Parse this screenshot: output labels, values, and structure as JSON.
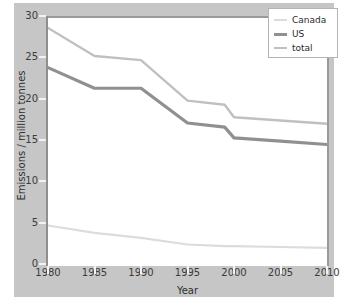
{
  "chart_data": {
    "type": "line",
    "title": "",
    "xlabel": "Year",
    "ylabel": "Emissions / million tonnes",
    "xlim": [
      1980,
      2010
    ],
    "ylim": [
      0,
      30
    ],
    "grid": false,
    "legend_position": "top-right",
    "x": [
      1980,
      1985,
      1990,
      1995,
      1999,
      2000,
      2005,
      2010
    ],
    "xticks": [
      "1980",
      "1985",
      "1990",
      "1995",
      "2000",
      "2005",
      "2010"
    ],
    "yticks": [
      "0",
      "5",
      "10",
      "15",
      "20",
      "25",
      "30"
    ],
    "series": [
      {
        "name": "Canada",
        "color": "#dcdcdc",
        "width": 2.2,
        "values": [
          4.9,
          4.0,
          3.4,
          2.6,
          2.4,
          2.4,
          2.3,
          2.2
        ]
      },
      {
        "name": "US",
        "color": "#909090",
        "width": 3.2,
        "values": [
          24.0,
          21.5,
          21.5,
          17.3,
          16.8,
          15.5,
          15.1,
          14.7
        ]
      },
      {
        "name": "total",
        "color": "#c0c0c0",
        "width": 2.4,
        "values": [
          28.8,
          25.4,
          24.9,
          20.0,
          19.5,
          18.0,
          17.6,
          17.2
        ]
      }
    ]
  },
  "legend": {
    "entries": [
      {
        "label": "Canada"
      },
      {
        "label": "US"
      },
      {
        "label": "total"
      }
    ]
  },
  "colors": {
    "panel_background": "#c6c6c6",
    "plot_background": "#ffffff",
    "axis": "#8f8f8f",
    "tick_text": "#3b3b3b",
    "legend_border": "#b4b4b4"
  }
}
